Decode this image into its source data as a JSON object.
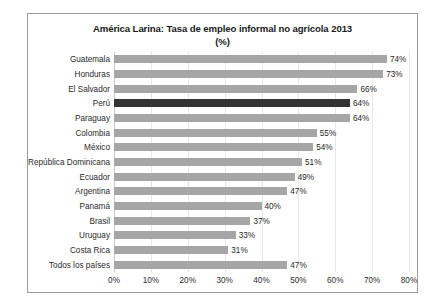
{
  "chart_data": {
    "type": "bar",
    "orientation": "horizontal",
    "title": "América Larina: Tasa de empleo informal no agrícola 2013",
    "subtitle": "(%)",
    "xlabel": "",
    "ylabel": "",
    "xlim": [
      0,
      80
    ],
    "xtick_labels": [
      "0%",
      "10%",
      "20%",
      "30%",
      "40%",
      "50%",
      "60%",
      "70%",
      "80%"
    ],
    "xtick_values": [
      0,
      10,
      20,
      30,
      40,
      50,
      60,
      70,
      80
    ],
    "grid": true,
    "legend": "none",
    "bar_color": "#a6a6a6",
    "highlight_color": "#333333",
    "highlight_category": "Perú",
    "categories": [
      "Guatemala",
      "Honduras",
      "El Salvador",
      "Perú",
      "Paraguay",
      "Colombia",
      "México",
      "República Dominicana",
      "Ecuador",
      "Argentina",
      "Panamá",
      "Brasil",
      "Uruguay",
      "Costa Rica",
      "Todos los países"
    ],
    "values": [
      74,
      73,
      66,
      64,
      64,
      55,
      54,
      51,
      49,
      47,
      40,
      37,
      33,
      31,
      47
    ],
    "data_labels": [
      "74%",
      "73%",
      "66%",
      "64%",
      "64%",
      "55%",
      "54%",
      "51%",
      "49%",
      "47%",
      "40%",
      "37%",
      "33%",
      "31%",
      "47%"
    ]
  }
}
